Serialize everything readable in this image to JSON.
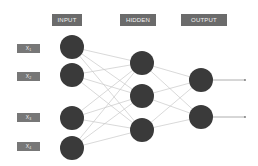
{
  "diagram": {
    "type": "neural-network",
    "layers": [
      {
        "name": "input",
        "header": "INPUT",
        "node_count": 4
      },
      {
        "name": "hidden",
        "header": "HIDDEN",
        "node_count": 3
      },
      {
        "name": "output",
        "header": "OUTPUT",
        "node_count": 2
      }
    ],
    "input_labels": [
      {
        "base": "X",
        "sub": "1"
      },
      {
        "base": "X",
        "sub": "2"
      },
      {
        "base": "X",
        "sub": "3"
      },
      {
        "base": "X",
        "sub": "4"
      }
    ],
    "colors": {
      "node": "#3a3a3a",
      "header_bg": "#6b6b6b",
      "label_bg": "#777777",
      "edge": "#c8c8c8",
      "output_line": "#999999"
    }
  }
}
